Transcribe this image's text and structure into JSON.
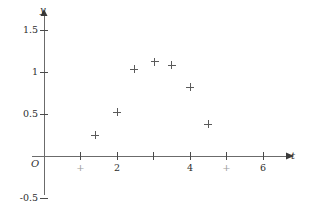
{
  "chart_data": {
    "type": "scatter",
    "title": "",
    "xlabel": "t",
    "ylabel": "y",
    "xlim": [
      -0.2,
      6.6
    ],
    "ylim": [
      -0.65,
      1.75
    ],
    "grid": false,
    "legend": null,
    "marker": "plus",
    "x_ticks": [
      {
        "value": 1,
        "label": "+"
      },
      {
        "value": 2,
        "label": "2"
      },
      {
        "value": 3,
        "label": ""
      },
      {
        "value": 4,
        "label": "4"
      },
      {
        "value": 5,
        "label": "+"
      },
      {
        "value": 6,
        "label": "6"
      }
    ],
    "y_ticks": [
      {
        "value": 1.5,
        "label": "1.5"
      },
      {
        "value": 1.0,
        "label": "1"
      },
      {
        "value": 0.5,
        "label": "0.5"
      },
      {
        "value": -0.5,
        "label": "-0.5"
      }
    ],
    "origin_label": "O",
    "x": [
      1.4,
      2.0,
      2.47,
      3.04,
      3.5,
      4.0,
      4.5
    ],
    "y": [
      0.25,
      0.52,
      1.03,
      1.12,
      1.08,
      0.82,
      0.38
    ],
    "points": [
      {
        "t": 1.4,
        "y": 0.25
      },
      {
        "t": 2.0,
        "y": 0.52
      },
      {
        "t": 2.47,
        "y": 1.03
      },
      {
        "t": 3.04,
        "y": 1.12
      },
      {
        "t": 3.5,
        "y": 1.08
      },
      {
        "t": 4.0,
        "y": 0.82
      },
      {
        "t": 4.5,
        "y": 0.38
      }
    ]
  },
  "axes": {
    "x_axis_name": "t",
    "y_axis_name": "y"
  }
}
